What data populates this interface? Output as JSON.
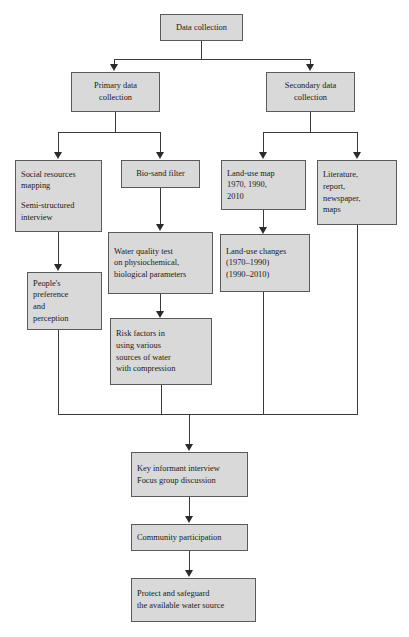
{
  "diagram": {
    "box_fill": "#d9d9d9",
    "box_border": "#5a5a5a",
    "connector_color": "#3a3a3a",
    "background": "#ffffff"
  },
  "nodes": {
    "data_collection": "Data collection",
    "primary": "Primary data\ncollection",
    "secondary": "Secondary data\ncollection",
    "social_mapping_l1": "Social resources",
    "social_mapping_l2": "mapping",
    "social_mapping_l3": "Semi-structured",
    "social_mapping_l4": "interview",
    "biosand": "Bio-sand filter",
    "landuse_map": "Land-use map\n1970, 1990,\n2010",
    "literature": "Literature,\nreport,\nnewspaper,\nmaps",
    "peoples_pref": "People's\npreference\nand\nperception",
    "water_quality": "Water quality test\non physiochemical,\nbiological parameters",
    "landuse_changes": "Land-use changes\n(1970–1990)\n(1990–2010)",
    "risk_factors": "Risk factors in\nusing various\nsources of water\nwith compression",
    "key_informant": "Key informant interview\nFocus group discussion",
    "community": "Community participation",
    "protect": "Protect and safeguard\nthe available water source"
  }
}
